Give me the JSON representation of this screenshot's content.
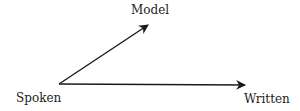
{
  "diagram": {
    "nodes": {
      "origin": "Spoken",
      "upper": "Model",
      "right": "Written"
    },
    "edges": [
      {
        "from": "Spoken",
        "to": "Model"
      },
      {
        "from": "Spoken",
        "to": "Written"
      }
    ],
    "stroke_color": "#1a1a1a"
  }
}
